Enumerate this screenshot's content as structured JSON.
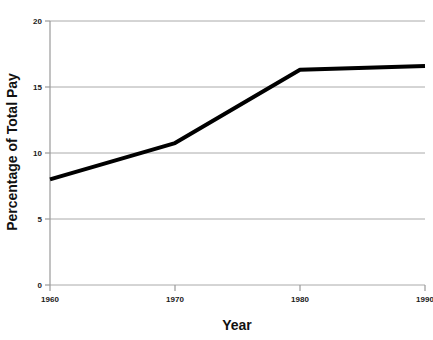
{
  "chart_data": {
    "type": "line",
    "title": "",
    "subtitle": "",
    "xlabel": "Year",
    "ylabel": "Percentage of Total Pay",
    "x": [
      1960,
      1970,
      1980,
      1990
    ],
    "values": [
      8.0,
      10.75,
      16.3,
      16.6
    ],
    "series": [
      {
        "name": "Percentage of Total Pay",
        "values": [
          8.0,
          10.75,
          16.3,
          16.6
        ],
        "color": "#000000",
        "line_width": 4
      }
    ],
    "xlim": [
      1960,
      1990
    ],
    "ylim": [
      0,
      20
    ],
    "xticks": [
      1960,
      1970,
      1980,
      1990
    ],
    "xtick_labels": [
      "1960",
      "1970",
      "1980",
      "1990"
    ],
    "yticks": [
      0,
      5,
      10,
      15,
      20
    ],
    "ytick_labels": [
      "0",
      "5",
      "10",
      "15",
      "20"
    ],
    "grid": true,
    "grid_axis": "y",
    "grid_color": "#aaaaaa",
    "legend": false,
    "legend_position": "none",
    "annotations": [],
    "axis_color": "#999999",
    "background_color": "#ffffff"
  }
}
